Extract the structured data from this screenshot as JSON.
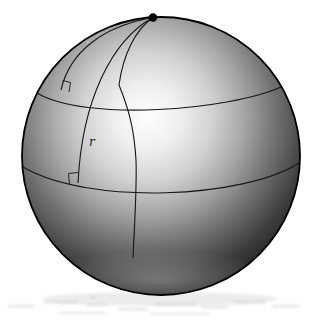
{
  "figure": {
    "kind": "sphere geometry diagram",
    "labels": {
      "radius": "r"
    },
    "elements": {
      "pole_point": "pole-point",
      "upper_small_circle": "upper-latitude-circle",
      "lower_small_circle": "lower-latitude-circle",
      "meridian_arc_left": "meridian-arc-left",
      "meridian_arc_middle": "meridian-arc-middle",
      "meridian_arc_right": "meridian-arc-right",
      "right_angle_marker_upper": "right-angle-marker-upper",
      "right_angle_marker_lower": "right-angle-marker-lower"
    },
    "colors": {
      "background": "#ffffff",
      "outline": "#000000",
      "line": "#1a1a1a",
      "pole_dot": "#000000",
      "highlight": "#fefefe",
      "shadow": "#0c0c0c"
    }
  }
}
